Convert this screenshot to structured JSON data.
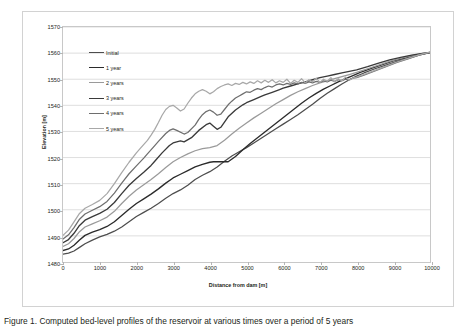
{
  "figure": {
    "caption": "Figure 1. Computed bed-level profiles of the reservoir at various times over a period of 5 years"
  },
  "chart_data": {
    "type": "line",
    "title": "",
    "xlabel": "Distance from dam [m]",
    "ylabel": "Elevation [m]",
    "xlim": [
      0,
      10000
    ],
    "ylim": [
      1480,
      1570
    ],
    "xticks": [
      0,
      1000,
      2000,
      3000,
      4000,
      5000,
      6000,
      7000,
      8000,
      9000,
      10000
    ],
    "yticks": [
      1480,
      1490,
      1500,
      1510,
      1520,
      1530,
      1540,
      1550,
      1560,
      1570
    ],
    "grid": "horizontal",
    "legend_position": "top-left",
    "series": [
      {
        "name": "Initial",
        "color": "#4d4d4d",
        "width": 1.25,
        "x": [
          0,
          150,
          300,
          450,
          600,
          800,
          1000,
          1200,
          1400,
          1600,
          1800,
          2000,
          2200,
          2400,
          2600,
          2800,
          3000,
          3200,
          3400,
          3600,
          3800,
          4000,
          4200,
          4400,
          4600,
          4800,
          5000,
          5200,
          5400,
          5600,
          5800,
          6000,
          6200,
          6400,
          6600,
          6800,
          7000,
          7200,
          7400,
          7600,
          7800,
          8000,
          8200,
          8500,
          8800,
          9100,
          9400,
          9700,
          10000
        ],
        "y": [
          1483.0,
          1483.4,
          1484.2,
          1485.6,
          1487.0,
          1488.4,
          1489.6,
          1490.6,
          1491.8,
          1493.4,
          1495.4,
          1497.4,
          1499.0,
          1500.6,
          1502.4,
          1504.4,
          1506.2,
          1507.6,
          1509.4,
          1511.6,
          1513.2,
          1514.6,
          1516.4,
          1518.6,
          1520.6,
          1522.2,
          1523.8,
          1525.6,
          1527.4,
          1529.2,
          1531.0,
          1532.8,
          1534.6,
          1536.4,
          1538.4,
          1540.4,
          1542.6,
          1544.6,
          1546.4,
          1548.2,
          1549.8,
          1551.2,
          1552.4,
          1554.0,
          1555.4,
          1556.8,
          1558.0,
          1559.2,
          1560.2
        ]
      },
      {
        "name": "1 year",
        "color": "#2b2b2b",
        "width": 1.35,
        "x": [
          0,
          150,
          300,
          450,
          600,
          800,
          1000,
          1200,
          1400,
          1600,
          1800,
          2000,
          2200,
          2400,
          2600,
          2800,
          3000,
          3200,
          3400,
          3600,
          3800,
          4000,
          4100,
          4300,
          4500,
          4700,
          4900,
          5100,
          5300,
          5500,
          5700,
          5900,
          6100,
          6300,
          6500,
          6700,
          6900,
          7100,
          7300,
          7500,
          7700,
          7900,
          8100,
          8400,
          8700,
          9000,
          9400,
          9700,
          10000
        ],
        "y": [
          1484.4,
          1485.0,
          1486.4,
          1488.4,
          1490.2,
          1491.4,
          1492.4,
          1493.6,
          1495.4,
          1497.8,
          1500.2,
          1502.4,
          1504.2,
          1506.0,
          1508.0,
          1510.2,
          1512.2,
          1513.6,
          1515.0,
          1516.4,
          1517.4,
          1518.2,
          1518.4,
          1518.4,
          1518.4,
          1520.4,
          1523.0,
          1525.4,
          1527.6,
          1529.8,
          1532.0,
          1534.2,
          1536.4,
          1538.6,
          1540.8,
          1542.8,
          1544.6,
          1546.2,
          1547.6,
          1549.0,
          1550.2,
          1551.4,
          1552.6,
          1554.2,
          1555.6,
          1557.0,
          1558.4,
          1559.4,
          1560.2
        ]
      },
      {
        "name": "2 years",
        "color": "#9a9a9a",
        "width": 1.25,
        "x": [
          0,
          150,
          300,
          450,
          600,
          800,
          1000,
          1200,
          1400,
          1600,
          1800,
          2000,
          2200,
          2400,
          2600,
          2800,
          3000,
          3200,
          3400,
          3600,
          3800,
          4000,
          4200,
          4400,
          4600,
          4800,
          5000,
          5200,
          5400,
          5600,
          5800,
          6000,
          6200,
          6400,
          6600,
          6800,
          7000,
          7200,
          7400,
          7600,
          7800,
          8000,
          8300,
          8600,
          8900,
          9200,
          9500,
          9800,
          10000
        ],
        "y": [
          1486.0,
          1487.0,
          1489.0,
          1491.6,
          1493.4,
          1494.6,
          1495.8,
          1497.2,
          1499.4,
          1502.4,
          1505.2,
          1507.6,
          1509.6,
          1511.6,
          1513.8,
          1516.2,
          1518.4,
          1520.0,
          1521.4,
          1522.6,
          1523.4,
          1523.8,
          1524.6,
          1526.6,
          1529.0,
          1531.2,
          1533.2,
          1535.2,
          1537.0,
          1538.8,
          1540.6,
          1542.2,
          1543.8,
          1545.2,
          1546.4,
          1547.6,
          1548.6,
          1549.4,
          1550.2,
          1551.0,
          1551.8,
          1552.6,
          1554.0,
          1555.4,
          1556.8,
          1558.0,
          1559.0,
          1559.9,
          1560.3
        ]
      },
      {
        "name": "3 years",
        "color": "#3a3a3a",
        "width": 1.35,
        "x": [
          0,
          150,
          300,
          450,
          600,
          800,
          1000,
          1200,
          1400,
          1600,
          1800,
          2000,
          2200,
          2400,
          2500,
          2700,
          2900,
          3000,
          3200,
          3300,
          3500,
          3700,
          3900,
          4000,
          4100,
          4200,
          4300,
          4400,
          4500,
          4700,
          4900,
          5000,
          5200,
          5400,
          5500,
          5700,
          5900,
          6000,
          6200,
          6400,
          6600,
          6800,
          7000,
          7200,
          7400,
          7600,
          7800,
          8000,
          8300,
          8600,
          8900,
          9200,
          9500,
          9800,
          10000
        ],
        "y": [
          1487.4,
          1488.6,
          1491.0,
          1494.0,
          1496.0,
          1497.4,
          1498.6,
          1500.2,
          1502.8,
          1506.2,
          1509.4,
          1512.0,
          1514.4,
          1517.0,
          1518.6,
          1521.8,
          1524.6,
          1525.6,
          1526.4,
          1526.0,
          1527.6,
          1530.4,
          1532.6,
          1533.2,
          1532.0,
          1530.8,
          1531.6,
          1533.6,
          1535.6,
          1538.2,
          1540.2,
          1541.0,
          1542.2,
          1543.4,
          1544.0,
          1545.0,
          1546.0,
          1546.6,
          1547.4,
          1548.2,
          1549.0,
          1549.8,
          1550.6,
          1551.2,
          1551.8,
          1552.4,
          1553.0,
          1553.6,
          1554.8,
          1556.2,
          1557.4,
          1558.4,
          1559.2,
          1559.9,
          1560.3
        ]
      },
      {
        "name": "4 years",
        "color": "#6e6e6e",
        "width": 1.25,
        "x": [
          0,
          150,
          300,
          450,
          600,
          800,
          1000,
          1200,
          1400,
          1600,
          1800,
          2000,
          2200,
          2300,
          2500,
          2600,
          2800,
          2900,
          3000,
          3100,
          3300,
          3400,
          3600,
          3700,
          3800,
          3900,
          4000,
          4100,
          4200,
          4300,
          4400,
          4500,
          4600,
          4700,
          4800,
          4900,
          5000,
          5100,
          5200,
          5300,
          5400,
          5500,
          5600,
          5700,
          5800,
          5900,
          6000,
          6100,
          6200,
          6300,
          6400,
          6500,
          6600,
          6700,
          6800,
          6900,
          7000,
          7100,
          7200,
          7300,
          7400,
          7500,
          7600,
          7700,
          7800,
          7900,
          8000,
          8200,
          8500,
          8800,
          9100,
          9400,
          9700,
          10000
        ],
        "y": [
          1488.8,
          1490.4,
          1493.2,
          1496.4,
          1498.4,
          1499.8,
          1501.2,
          1503.2,
          1506.4,
          1510.2,
          1513.8,
          1516.8,
          1519.8,
          1521.4,
          1524.6,
          1526.2,
          1529.2,
          1530.4,
          1531.0,
          1530.4,
          1529.0,
          1529.6,
          1532.4,
          1534.6,
          1536.4,
          1537.6,
          1538.2,
          1537.4,
          1536.2,
          1536.6,
          1538.4,
          1540.2,
          1541.6,
          1542.8,
          1543.6,
          1544.4,
          1545.2,
          1545.0,
          1545.8,
          1546.4,
          1546.0,
          1546.8,
          1547.4,
          1547.0,
          1547.8,
          1548.2,
          1547.8,
          1548.4,
          1548.0,
          1548.6,
          1548.2,
          1548.8,
          1548.4,
          1549.0,
          1548.6,
          1549.2,
          1548.8,
          1549.4,
          1549.0,
          1549.6,
          1549.2,
          1549.8,
          1549.4,
          1550.0,
          1549.8,
          1550.4,
          1550.6,
          1551.6,
          1553.2,
          1554.8,
          1556.4,
          1557.8,
          1559.2,
          1560.3
        ]
      },
      {
        "name": "5 years",
        "color": "#a8a8a8",
        "width": 1.25,
        "x": [
          0,
          150,
          300,
          450,
          600,
          800,
          1000,
          1200,
          1400,
          1600,
          1800,
          2000,
          2100,
          2300,
          2400,
          2500,
          2600,
          2700,
          2800,
          2900,
          3000,
          3100,
          3200,
          3300,
          3400,
          3500,
          3600,
          3700,
          3800,
          3900,
          4000,
          4100,
          4200,
          4300,
          4400,
          4500,
          4600,
          4700,
          4800,
          4900,
          5000,
          5100,
          5200,
          5300,
          5400,
          5500,
          5600,
          5700,
          5800,
          5900,
          6000,
          6100,
          6200,
          6300,
          6400,
          6500,
          6600,
          6700,
          6800,
          6900,
          7000,
          7100,
          7200,
          7300,
          7400,
          7500,
          7600,
          7700,
          7800,
          7900,
          8000,
          8200,
          8500,
          8800,
          9100,
          9400,
          9700,
          10000
        ],
        "y": [
          1490.2,
          1492.2,
          1495.4,
          1498.6,
          1500.6,
          1502.0,
          1503.6,
          1506.2,
          1510.0,
          1514.2,
          1518.2,
          1521.8,
          1523.4,
          1526.6,
          1528.6,
          1530.8,
          1533.4,
          1536.2,
          1538.4,
          1539.6,
          1540.0,
          1539.0,
          1537.8,
          1538.6,
          1540.8,
          1542.8,
          1544.4,
          1545.4,
          1546.0,
          1545.4,
          1544.4,
          1545.2,
          1546.4,
          1547.2,
          1547.8,
          1548.2,
          1547.6,
          1548.4,
          1548.0,
          1548.8,
          1548.2,
          1549.0,
          1548.4,
          1549.4,
          1548.6,
          1549.6,
          1548.8,
          1549.8,
          1548.6,
          1549.4,
          1548.8,
          1550.0,
          1548.4,
          1549.6,
          1548.8,
          1550.2,
          1548.6,
          1549.8,
          1549.0,
          1550.4,
          1548.8,
          1550.0,
          1549.2,
          1550.6,
          1549.0,
          1550.2,
          1549.4,
          1550.8,
          1549.6,
          1550.4,
          1550.8,
          1551.8,
          1553.4,
          1555.0,
          1556.6,
          1558.0,
          1559.3,
          1560.4
        ]
      }
    ]
  }
}
